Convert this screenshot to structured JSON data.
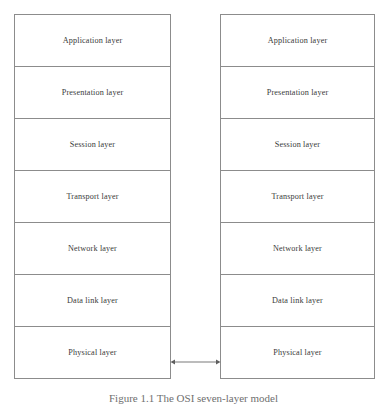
{
  "figure": {
    "caption": "Figure 1.1  The OSI seven-layer model",
    "caption_visible_note": "cut off at bottom edge",
    "background_color": "#ffffff",
    "border_color": "#8c8c8c",
    "text_color": "#3a3a3a"
  },
  "stacks": [
    {
      "id": "left",
      "name": "left-protocol-stack",
      "layers": [
        {
          "label": "Application layer"
        },
        {
          "label": "Presentation layer"
        },
        {
          "label": "Session layer"
        },
        {
          "label": "Transport layer"
        },
        {
          "label": "Network layer"
        },
        {
          "label": "Data link layer"
        },
        {
          "label": "Physical layer"
        }
      ]
    },
    {
      "id": "right",
      "name": "right-protocol-stack",
      "layers": [
        {
          "label": "Application layer"
        },
        {
          "label": "Presentation layer"
        },
        {
          "label": "Session layer"
        },
        {
          "label": "Transport layer"
        },
        {
          "label": "Network layer"
        },
        {
          "label": "Data link layer"
        },
        {
          "label": "Physical layer"
        }
      ]
    }
  ],
  "connector": {
    "name": "physical-layer-link",
    "type": "double-headed-arrow",
    "orientation": "horizontal",
    "color": "#7a7a7a",
    "connects": [
      "Physical layer",
      "Physical layer"
    ]
  }
}
